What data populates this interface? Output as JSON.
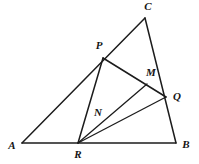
{
  "figure": {
    "background_color": "#ffffff",
    "stroke_color": "#1c1c1c",
    "label_color": "#141414",
    "width": 199,
    "height": 164
  },
  "points": {
    "A": {
      "label": "A",
      "x": 22,
      "y": 143,
      "lx": 12,
      "ly": 146
    },
    "B": {
      "label": "B",
      "x": 176,
      "y": 143,
      "lx": 186,
      "ly": 145
    },
    "C": {
      "label": "C",
      "x": 145,
      "y": 18,
      "lx": 148,
      "ly": 7
    },
    "P": {
      "label": "P",
      "x": 103,
      "y": 58,
      "lx": 99,
      "ly": 46
    },
    "Q": {
      "label": "Q",
      "x": 166,
      "y": 97,
      "lx": 177,
      "ly": 97
    },
    "R": {
      "label": "R",
      "x": 78,
      "y": 143,
      "lx": 78,
      "ly": 155
    },
    "M": {
      "label": "M",
      "x": 147,
      "y": 84,
      "lx": 151,
      "ly": 73
    },
    "N": {
      "label": "N",
      "x": 104,
      "y": 122,
      "lx": 98,
      "ly": 113
    }
  },
  "segments": [
    {
      "name": "side-AB",
      "from": "A",
      "to": "B"
    },
    {
      "name": "side-AC",
      "from": "A",
      "to": "C"
    },
    {
      "name": "side-CB",
      "from": "C",
      "to": "B"
    },
    {
      "name": "cevian-PQ",
      "from": "P",
      "to": "Q"
    },
    {
      "name": "cevian-PR",
      "from": "P",
      "to": "R"
    },
    {
      "name": "cevian-RQ",
      "from": "R",
      "to": "Q"
    },
    {
      "name": "cevian-RM",
      "from": "R",
      "to": "M"
    }
  ],
  "labels_order": [
    "C",
    "P",
    "M",
    "Q",
    "N",
    "A",
    "R",
    "B"
  ]
}
